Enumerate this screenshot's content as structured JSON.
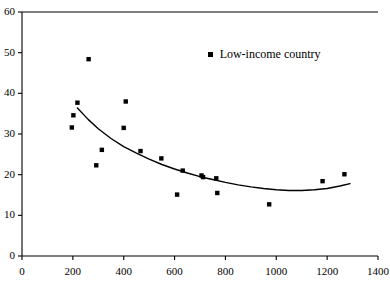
{
  "chart_data": {
    "type": "scatter",
    "title": "",
    "xlabel": "",
    "ylabel": "",
    "xlim": [
      0,
      1400
    ],
    "ylim": [
      0,
      60
    ],
    "xticks": [
      0,
      200,
      400,
      600,
      800,
      1000,
      1200,
      1400
    ],
    "yticks": [
      0,
      10,
      20,
      30,
      40,
      50,
      60
    ],
    "grid": false,
    "legend_position": "top-center",
    "marker_color": "#000000",
    "marker_shape": "square",
    "axis_color": "#000000",
    "background_color": "#ffffff",
    "series": [
      {
        "name": "Low-income country",
        "marker": "square",
        "color": "#000000",
        "points": [
          {
            "x": 196,
            "y": 31.6
          },
          {
            "x": 202,
            "y": 34.6
          },
          {
            "x": 218,
            "y": 37.7
          },
          {
            "x": 262,
            "y": 48.4
          },
          {
            "x": 292,
            "y": 22.3
          },
          {
            "x": 314,
            "y": 26.1
          },
          {
            "x": 400,
            "y": 31.5
          },
          {
            "x": 408,
            "y": 38.0
          },
          {
            "x": 466,
            "y": 25.8
          },
          {
            "x": 548,
            "y": 24.0
          },
          {
            "x": 610,
            "y": 15.1
          },
          {
            "x": 632,
            "y": 21.0
          },
          {
            "x": 706,
            "y": 19.8
          },
          {
            "x": 712,
            "y": 19.4
          },
          {
            "x": 764,
            "y": 19.1
          },
          {
            "x": 768,
            "y": 15.5
          },
          {
            "x": 972,
            "y": 12.7
          },
          {
            "x": 1182,
            "y": 18.4
          },
          {
            "x": 1268,
            "y": 20.1
          }
        ]
      }
    ],
    "trend_curve": {
      "name": "fitted-trend",
      "color": "#000000",
      "points": [
        {
          "x": 218,
          "y": 36.4
        },
        {
          "x": 260,
          "y": 33.6
        },
        {
          "x": 300,
          "y": 31.3
        },
        {
          "x": 350,
          "y": 28.9
        },
        {
          "x": 400,
          "y": 26.9
        },
        {
          "x": 450,
          "y": 25.3
        },
        {
          "x": 500,
          "y": 23.8
        },
        {
          "x": 550,
          "y": 22.5
        },
        {
          "x": 600,
          "y": 21.4
        },
        {
          "x": 650,
          "y": 20.4
        },
        {
          "x": 700,
          "y": 19.5
        },
        {
          "x": 750,
          "y": 18.8
        },
        {
          "x": 800,
          "y": 18.1
        },
        {
          "x": 850,
          "y": 17.5
        },
        {
          "x": 900,
          "y": 17.0
        },
        {
          "x": 950,
          "y": 16.6
        },
        {
          "x": 1000,
          "y": 16.3
        },
        {
          "x": 1050,
          "y": 16.1
        },
        {
          "x": 1100,
          "y": 16.1
        },
        {
          "x": 1150,
          "y": 16.3
        },
        {
          "x": 1200,
          "y": 16.6
        },
        {
          "x": 1250,
          "y": 17.2
        },
        {
          "x": 1290,
          "y": 17.8
        }
      ]
    }
  },
  "legend": {
    "label": "Low-income country",
    "marker_name": "legend-square-marker"
  },
  "axis_labels": {
    "y": [
      "60",
      "50",
      "40",
      "30",
      "20",
      "10",
      "0"
    ],
    "x": [
      "0",
      "200",
      "400",
      "600",
      "800",
      "1000",
      "1200",
      "1400"
    ]
  }
}
